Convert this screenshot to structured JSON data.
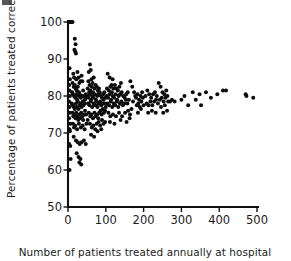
{
  "figure": {
    "kind": "funnel-plot",
    "background": "#ffffff",
    "marker_color": "#0d0d0d",
    "axis_color": "#101010"
  },
  "axes": {
    "y_title": "Percentage of patients treated correctly",
    "x_title": "Number of patients treated annually at hospital",
    "y_ticks": [
      "50",
      "60",
      "70",
      "80",
      "90",
      "100"
    ],
    "x_ticks": [
      "0",
      "100",
      "200",
      "300",
      "400",
      "500"
    ]
  },
  "chart_data": {
    "type": "scatter",
    "title": "",
    "xlabel": "Number of patients treated annually at hospital",
    "ylabel": "Percentage of patients treated correctly",
    "xlim": [
      0,
      500
    ],
    "ylim": [
      50,
      100
    ],
    "xticks": [
      0,
      100,
      200,
      300,
      400,
      500
    ],
    "yticks": [
      50,
      60,
      70,
      80,
      90,
      100
    ],
    "grid": false,
    "legend": "none",
    "marker": "filled-circle",
    "marker_size_px": 4,
    "points": [
      [
        3,
        100
      ],
      [
        6,
        100
      ],
      [
        9,
        100
      ],
      [
        12,
        100
      ],
      [
        4,
        87.5
      ],
      [
        5,
        84.5
      ],
      [
        3,
        83.0
      ],
      [
        4,
        81.5
      ],
      [
        5,
        80.0
      ],
      [
        3,
        78.5
      ],
      [
        4,
        77.0
      ],
      [
        5,
        75.5
      ],
      [
        3,
        74.0
      ],
      [
        6,
        72.5
      ],
      [
        4,
        71.0
      ],
      [
        5,
        70.5
      ],
      [
        3,
        67.0
      ],
      [
        6,
        66.5
      ],
      [
        4,
        60.0
      ],
      [
        7,
        63.0
      ],
      [
        18,
        95.5
      ],
      [
        20,
        94.0
      ],
      [
        17,
        92.5
      ],
      [
        19,
        92.0
      ],
      [
        21,
        91.5
      ],
      [
        14,
        86.0
      ],
      [
        16,
        85.0
      ],
      [
        22,
        84.5
      ],
      [
        25,
        86.5
      ],
      [
        28,
        85.0
      ],
      [
        12,
        83.5
      ],
      [
        15,
        82.5
      ],
      [
        18,
        83.0
      ],
      [
        20,
        82.0
      ],
      [
        23,
        81.5
      ],
      [
        26,
        82.5
      ],
      [
        30,
        83.5
      ],
      [
        33,
        84.0
      ],
      [
        36,
        85.5
      ],
      [
        38,
        84.0
      ],
      [
        11,
        81.0
      ],
      [
        13,
        80.5
      ],
      [
        16,
        80.0
      ],
      [
        19,
        79.5
      ],
      [
        22,
        80.5
      ],
      [
        24,
        79.0
      ],
      [
        27,
        80.0
      ],
      [
        29,
        81.0
      ],
      [
        31,
        80.5
      ],
      [
        34,
        79.5
      ],
      [
        37,
        80.0
      ],
      [
        40,
        81.5
      ],
      [
        42,
        80.0
      ],
      [
        45,
        79.0
      ],
      [
        47,
        80.5
      ],
      [
        10,
        78.0
      ],
      [
        13,
        77.5
      ],
      [
        15,
        77.0
      ],
      [
        18,
        76.5
      ],
      [
        21,
        78.0
      ],
      [
        23,
        77.0
      ],
      [
        26,
        78.5
      ],
      [
        28,
        76.5
      ],
      [
        31,
        77.5
      ],
      [
        33,
        78.0
      ],
      [
        36,
        77.0
      ],
      [
        39,
        78.5
      ],
      [
        41,
        77.5
      ],
      [
        44,
        78.0
      ],
      [
        46,
        79.5
      ],
      [
        12,
        75.5
      ],
      [
        14,
        74.5
      ],
      [
        17,
        75.0
      ],
      [
        20,
        74.0
      ],
      [
        22,
        75.5
      ],
      [
        25,
        74.5
      ],
      [
        27,
        73.5
      ],
      [
        30,
        75.0
      ],
      [
        32,
        74.0
      ],
      [
        35,
        75.5
      ],
      [
        38,
        74.5
      ],
      [
        40,
        73.5
      ],
      [
        43,
        75.0
      ],
      [
        45,
        76.0
      ],
      [
        48,
        75.0
      ],
      [
        13,
        72.5
      ],
      [
        16,
        71.5
      ],
      [
        19,
        72.0
      ],
      [
        24,
        71.0
      ],
      [
        29,
        72.5
      ],
      [
        34,
        71.5
      ],
      [
        39,
        72.0
      ],
      [
        44,
        71.0
      ],
      [
        49,
        72.5
      ],
      [
        52,
        73.5
      ],
      [
        15,
        69.0
      ],
      [
        21,
        68.0
      ],
      [
        26,
        67.5
      ],
      [
        31,
        67.0
      ],
      [
        36,
        67.5
      ],
      [
        42,
        68.0
      ],
      [
        47,
        67.0
      ],
      [
        23,
        64.5
      ],
      [
        28,
        63.5
      ],
      [
        30,
        62.0
      ],
      [
        33,
        63.0
      ],
      [
        35,
        61.5
      ],
      [
        55,
        86.5
      ],
      [
        58,
        88.5
      ],
      [
        60,
        87.0
      ],
      [
        54,
        84.0
      ],
      [
        57,
        83.0
      ],
      [
        62,
        84.5
      ],
      [
        65,
        83.5
      ],
      [
        68,
        85.0
      ],
      [
        52,
        82.0
      ],
      [
        56,
        81.0
      ],
      [
        59,
        81.5
      ],
      [
        63,
        82.5
      ],
      [
        66,
        81.0
      ],
      [
        70,
        82.0
      ],
      [
        73,
        83.0
      ],
      [
        76,
        82.5
      ],
      [
        79,
        81.5
      ],
      [
        82,
        82.0
      ],
      [
        51,
        80.0
      ],
      [
        54,
        79.5
      ],
      [
        58,
        80.5
      ],
      [
        61,
        79.0
      ],
      [
        64,
        80.0
      ],
      [
        67,
        79.5
      ],
      [
        71,
        80.5
      ],
      [
        74,
        79.0
      ],
      [
        77,
        80.0
      ],
      [
        80,
        80.5
      ],
      [
        84,
        81.0
      ],
      [
        87,
        80.0
      ],
      [
        90,
        79.5
      ],
      [
        93,
        80.5
      ],
      [
        96,
        81.0
      ],
      [
        53,
        78.0
      ],
      [
        57,
        77.5
      ],
      [
        60,
        78.5
      ],
      [
        64,
        77.0
      ],
      [
        68,
        78.0
      ],
      [
        72,
        77.5
      ],
      [
        75,
        78.5
      ],
      [
        78,
        77.0
      ],
      [
        81,
        78.0
      ],
      [
        85,
        78.5
      ],
      [
        88,
        77.5
      ],
      [
        91,
        78.0
      ],
      [
        94,
        79.0
      ],
      [
        97,
        78.0
      ],
      [
        99,
        79.5
      ],
      [
        55,
        75.5
      ],
      [
        59,
        74.5
      ],
      [
        62,
        75.0
      ],
      [
        66,
        74.0
      ],
      [
        70,
        75.5
      ],
      [
        73,
        74.5
      ],
      [
        77,
        75.0
      ],
      [
        80,
        74.0
      ],
      [
        83,
        75.5
      ],
      [
        86,
        76.0
      ],
      [
        89,
        75.0
      ],
      [
        92,
        76.5
      ],
      [
        95,
        75.5
      ],
      [
        98,
        76.0
      ],
      [
        100,
        77.0
      ],
      [
        58,
        72.5
      ],
      [
        63,
        71.5
      ],
      [
        67,
        72.0
      ],
      [
        72,
        71.0
      ],
      [
        76,
        72.5
      ],
      [
        81,
        73.0
      ],
      [
        85,
        72.0
      ],
      [
        90,
        73.5
      ],
      [
        94,
        72.5
      ],
      [
        98,
        73.0
      ],
      [
        61,
        69.5
      ],
      [
        69,
        69.0
      ],
      [
        78,
        70.5
      ],
      [
        88,
        71.0
      ],
      [
        105,
        86.0
      ],
      [
        110,
        85.0
      ],
      [
        118,
        84.5
      ],
      [
        115,
        83.0
      ],
      [
        103,
        82.0
      ],
      [
        108,
        81.5
      ],
      [
        112,
        82.5
      ],
      [
        116,
        81.0
      ],
      [
        120,
        82.0
      ],
      [
        124,
        83.0
      ],
      [
        128,
        82.0
      ],
      [
        132,
        81.5
      ],
      [
        136,
        82.5
      ],
      [
        140,
        83.5
      ],
      [
        102,
        80.0
      ],
      [
        106,
        79.5
      ],
      [
        110,
        80.5
      ],
      [
        114,
        79.0
      ],
      [
        118,
        80.0
      ],
      [
        122,
        79.5
      ],
      [
        126,
        80.5
      ],
      [
        130,
        79.0
      ],
      [
        134,
        80.0
      ],
      [
        138,
        80.5
      ],
      [
        142,
        81.0
      ],
      [
        146,
        80.0
      ],
      [
        150,
        79.5
      ],
      [
        154,
        80.5
      ],
      [
        158,
        81.0
      ],
      [
        104,
        78.0
      ],
      [
        109,
        77.5
      ],
      [
        113,
        78.5
      ],
      [
        117,
        77.0
      ],
      [
        121,
        78.0
      ],
      [
        125,
        77.5
      ],
      [
        129,
        78.5
      ],
      [
        133,
        77.0
      ],
      [
        137,
        78.0
      ],
      [
        141,
        78.5
      ],
      [
        145,
        77.5
      ],
      [
        149,
        78.0
      ],
      [
        153,
        79.0
      ],
      [
        157,
        78.0
      ],
      [
        161,
        79.0
      ],
      [
        107,
        75.5
      ],
      [
        112,
        74.5
      ],
      [
        119,
        75.0
      ],
      [
        127,
        74.5
      ],
      [
        135,
        75.5
      ],
      [
        143,
        74.5
      ],
      [
        151,
        75.5
      ],
      [
        159,
        76.0
      ],
      [
        164,
        75.0
      ],
      [
        168,
        76.5
      ],
      [
        111,
        73.0
      ],
      [
        123,
        72.5
      ],
      [
        139,
        73.5
      ],
      [
        155,
        73.0
      ],
      [
        163,
        74.0
      ],
      [
        165,
        84.0
      ],
      [
        170,
        82.5
      ],
      [
        175,
        81.0
      ],
      [
        178,
        80.0
      ],
      [
        172,
        78.5
      ],
      [
        180,
        79.5
      ],
      [
        184,
        80.5
      ],
      [
        188,
        79.0
      ],
      [
        192,
        80.0
      ],
      [
        196,
        81.0
      ],
      [
        182,
        77.5
      ],
      [
        186,
        78.0
      ],
      [
        190,
        77.0
      ],
      [
        194,
        78.5
      ],
      [
        198,
        79.5
      ],
      [
        185,
        75.5
      ],
      [
        193,
        76.5
      ],
      [
        200,
        77.5
      ],
      [
        205,
        80.0
      ],
      [
        210,
        81.5
      ],
      [
        215,
        80.5
      ],
      [
        220,
        79.5
      ],
      [
        225,
        80.5
      ],
      [
        230,
        81.0
      ],
      [
        235,
        80.0
      ],
      [
        208,
        78.0
      ],
      [
        213,
        77.5
      ],
      [
        218,
        78.5
      ],
      [
        223,
        77.5
      ],
      [
        228,
        78.5
      ],
      [
        233,
        79.0
      ],
      [
        238,
        78.0
      ],
      [
        212,
        75.5
      ],
      [
        222,
        76.0
      ],
      [
        232,
        75.5
      ],
      [
        240,
        83.5
      ],
      [
        245,
        82.5
      ],
      [
        250,
        81.0
      ],
      [
        255,
        80.5
      ],
      [
        260,
        81.5
      ],
      [
        243,
        79.0
      ],
      [
        248,
        79.5
      ],
      [
        253,
        78.5
      ],
      [
        258,
        79.5
      ],
      [
        263,
        80.0
      ],
      [
        246,
        77.0
      ],
      [
        256,
        77.5
      ],
      [
        265,
        78.5
      ],
      [
        252,
        75.5
      ],
      [
        262,
        76.0
      ],
      [
        270,
        78.5
      ],
      [
        275,
        79.0
      ],
      [
        282,
        78.5
      ],
      [
        300,
        79.0
      ],
      [
        308,
        80.0
      ],
      [
        318,
        77.5
      ],
      [
        330,
        81.0
      ],
      [
        338,
        79.0
      ],
      [
        348,
        80.5
      ],
      [
        352,
        77.5
      ],
      [
        365,
        81.0
      ],
      [
        378,
        79.5
      ],
      [
        395,
        80.5
      ],
      [
        410,
        81.5
      ],
      [
        418,
        81.5
      ],
      [
        470,
        80.5
      ],
      [
        472,
        80.0
      ],
      [
        490,
        79.5
      ]
    ]
  }
}
